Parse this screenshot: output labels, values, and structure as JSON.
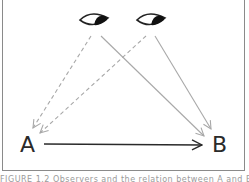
{
  "diagram": {
    "type": "causal-observation-diagram",
    "nodes": [
      {
        "id": "A",
        "label": "A"
      },
      {
        "id": "B",
        "label": "B"
      }
    ],
    "observers": [
      {
        "id": "eye-left",
        "icon": "eye-icon"
      },
      {
        "id": "eye-right",
        "icon": "eye-icon"
      }
    ],
    "edges": [
      {
        "from": "A",
        "to": "B",
        "style": "solid",
        "color": "#2a2a2a"
      },
      {
        "from": "eye-left",
        "to": "A",
        "style": "dashed",
        "color": "#a8a8a8"
      },
      {
        "from": "eye-right",
        "to": "A",
        "style": "dashed",
        "color": "#a8a8a8"
      },
      {
        "from": "eye-left",
        "to": "B",
        "style": "solid",
        "color": "#a8a8a8"
      },
      {
        "from": "eye-right",
        "to": "B",
        "style": "solid",
        "color": "#a8a8a8"
      }
    ],
    "colors": {
      "frame": "#8a8a8a",
      "main_arrow": "#2a2a2a",
      "observer_arrows": "#a8a8a8",
      "eye_outline": "#222222",
      "pupil": "#111111"
    }
  },
  "caption": {
    "text": "FIGURE 1.2 Observers and the relation between A and B"
  }
}
